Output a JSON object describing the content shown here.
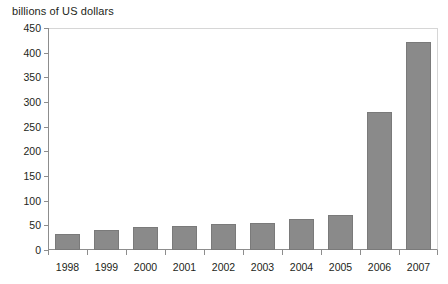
{
  "chart_data": {
    "type": "bar",
    "title": "",
    "ylabel": "billions of US dollars",
    "xlabel": "",
    "categories": [
      "1998",
      "1999",
      "2000",
      "2001",
      "2002",
      "2003",
      "2004",
      "2005",
      "2006",
      "2007"
    ],
    "values": [
      32,
      40,
      46,
      49,
      52,
      55,
      63,
      70,
      280,
      422
    ],
    "ylim": [
      0,
      450
    ],
    "y_ticks": [
      0,
      50,
      100,
      150,
      200,
      250,
      300,
      350,
      400,
      450
    ],
    "y_tick_labels": [
      "0",
      "50",
      "100",
      "150",
      "200",
      "250",
      "300",
      "350",
      "400",
      "450"
    ],
    "grid": false,
    "legend": null,
    "bar_color": "#8a8a8a",
    "axis_color": "#8d8d8d",
    "frame_color": "#d6d6d6",
    "text_color": "#231f20"
  }
}
